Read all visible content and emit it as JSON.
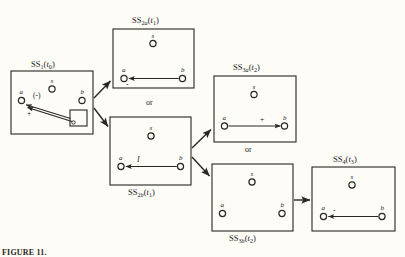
{
  "figure": {
    "caption": "FIGURE 11.",
    "background_color": "#fdfcf7",
    "ink_color": "#2a2622"
  },
  "connector_labels": [
    {
      "id": "or-top",
      "text": "or"
    },
    {
      "id": "or-bottom",
      "text": "or"
    }
  ],
  "states": [
    {
      "id": "ss1",
      "label_parts": {
        "name": "SS",
        "sub": "1",
        "time": "t",
        "time_sub": "0"
      },
      "label_text": "SS1(t0)",
      "label_position": "top",
      "nodes": [
        {
          "id": "a",
          "label": "a"
        },
        {
          "id": "s",
          "label": "s"
        },
        {
          "id": "b",
          "label": "b"
        }
      ],
      "relations": [
        {
          "from": "box",
          "to": "a",
          "label": "(-)",
          "label_kind": "sign"
        },
        {
          "from": "box",
          "to": "a",
          "label": "+",
          "label_kind": "sign"
        }
      ],
      "has_mini_box": true
    },
    {
      "id": "ss2a",
      "label_parts": {
        "name": "SS",
        "sub": "2",
        "sub2": "a",
        "time": "t",
        "time_sub": "1"
      },
      "label_text": "SS2a(t1)",
      "label_position": "top",
      "nodes": [
        {
          "id": "a",
          "label": "a"
        },
        {
          "id": "s",
          "label": "s"
        },
        {
          "id": "b",
          "label": "b"
        }
      ],
      "relations": [
        {
          "from": "b",
          "to": "a",
          "label": "-",
          "label_kind": "sign"
        }
      ],
      "has_mini_box": false
    },
    {
      "id": "ss2b",
      "label_parts": {
        "name": "SS",
        "sub": "2",
        "sub2": "b",
        "time": "t",
        "time_sub": "1"
      },
      "label_text": "SS2b(t1)",
      "label_position": "bottom",
      "nodes": [
        {
          "id": "a",
          "label": "a"
        },
        {
          "id": "s",
          "label": "s"
        },
        {
          "id": "b",
          "label": "b"
        }
      ],
      "relations": [
        {
          "from": "b",
          "to": "a",
          "label": "I",
          "label_kind": "rel"
        }
      ],
      "has_mini_box": false
    },
    {
      "id": "ss3a",
      "label_parts": {
        "name": "SS",
        "sub": "3",
        "sub2": "a",
        "time": "t",
        "time_sub": "2"
      },
      "label_text": "SS3a(t2)",
      "label_position": "top",
      "nodes": [
        {
          "id": "a",
          "label": "a"
        },
        {
          "id": "s",
          "label": "s"
        },
        {
          "id": "b",
          "label": "b"
        }
      ],
      "relations": [
        {
          "from": "a",
          "to": "b",
          "label": "+",
          "label_kind": "sign"
        }
      ],
      "has_mini_box": false
    },
    {
      "id": "ss3b",
      "label_parts": {
        "name": "SS",
        "sub": "3",
        "sub2": "b",
        "time": "t",
        "time_sub": "2"
      },
      "label_text": "SS3b(t2)",
      "label_position": "bottom",
      "nodes": [
        {
          "id": "a",
          "label": "a"
        },
        {
          "id": "s",
          "label": "s"
        },
        {
          "id": "b",
          "label": "b"
        }
      ],
      "relations": [],
      "has_mini_box": false
    },
    {
      "id": "ss4",
      "label_parts": {
        "name": "SS",
        "sub": "4",
        "time": "t",
        "time_sub": "3"
      },
      "label_text": "SS4(t3)",
      "label_position": "top",
      "nodes": [
        {
          "id": "a",
          "label": "a"
        },
        {
          "id": "s",
          "label": "s"
        },
        {
          "id": "b",
          "label": "b"
        }
      ],
      "relations": [
        {
          "from": "b",
          "to": "a",
          "label": "-",
          "label_kind": "sign"
        }
      ],
      "has_mini_box": false
    }
  ],
  "transitions": [
    {
      "from": "ss1",
      "to": "ss2a"
    },
    {
      "from": "ss1",
      "to": "ss2b"
    },
    {
      "from": "ss2b",
      "to": "ss3a"
    },
    {
      "from": "ss2b",
      "to": "ss3b"
    },
    {
      "from": "ss3b",
      "to": "ss4"
    }
  ]
}
